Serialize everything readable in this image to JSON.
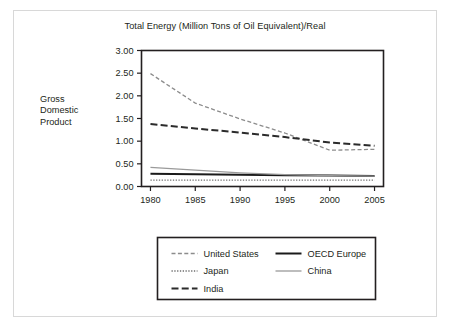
{
  "figure": {
    "title": "Total Energy (Million Tons of Oil Equivalent)/Real",
    "y_axis_title_lines": [
      "Gross",
      "Domestic",
      "Product"
    ],
    "y_axis_title": "Gross Domestic Product"
  },
  "colors": {
    "text": "#231f20",
    "outer_frame": "#d8d8d8",
    "plot_frame": "#231f20",
    "united_states": "#8c8c8c",
    "japan": "#6e6e6e",
    "india": "#2b2b2b",
    "oecd_europe": "#1a1a1a",
    "china": "#9a9a9a",
    "background": "#ffffff"
  },
  "chart_data": {
    "type": "line",
    "title": "Total Energy (Million Tons of Oil Equivalent)/Real",
    "xlabel": "",
    "ylabel": "Gross Domestic Product",
    "xlim": [
      1979,
      2006
    ],
    "ylim": [
      0.0,
      3.0
    ],
    "grid": false,
    "legend_position": "bottom",
    "x_ticks": [
      1980,
      1985,
      1990,
      1995,
      2000,
      2005
    ],
    "x_tick_labels": [
      "1980",
      "1985",
      "1990",
      "1995",
      "2000",
      "2005"
    ],
    "y_ticks": [
      0.0,
      0.5,
      1.0,
      1.5,
      2.0,
      2.5,
      3.0
    ],
    "y_tick_labels": [
      "0.00",
      "0.50",
      "1.00",
      "1.50",
      "2.00",
      "2.50",
      "3.00"
    ],
    "x": [
      1980,
      1985,
      1990,
      1995,
      2000,
      2005
    ],
    "series": [
      {
        "name": "United States",
        "key": "united_states",
        "style": "dashed",
        "color": "#8c8c8c",
        "width": 1.3,
        "dash": "4,2.4",
        "values": [
          2.49,
          1.84,
          1.49,
          1.18,
          0.8,
          0.82
        ]
      },
      {
        "name": "Japan",
        "key": "japan",
        "style": "dotted",
        "color": "#6e6e6e",
        "width": 1.3,
        "dash": "1.3,1.5",
        "values": [
          0.14,
          0.14,
          0.14,
          0.14,
          0.14,
          0.14
        ]
      },
      {
        "name": "India",
        "key": "india",
        "style": "long-dashed",
        "color": "#2b2b2b",
        "width": 2.0,
        "dash": "7,3.2",
        "values": [
          1.38,
          1.28,
          1.19,
          1.09,
          0.97,
          0.9
        ]
      },
      {
        "name": "OECD Europe",
        "key": "oecd_europe",
        "style": "solid",
        "color": "#1a1a1a",
        "width": 2.0,
        "dash": "none",
        "values": [
          0.28,
          0.27,
          0.26,
          0.25,
          0.24,
          0.23
        ]
      },
      {
        "name": "China",
        "key": "china",
        "style": "solid",
        "color": "#9a9a9a",
        "width": 1.3,
        "dash": "none",
        "values": [
          0.42,
          0.36,
          0.3,
          0.26,
          0.24,
          0.23
        ]
      }
    ]
  },
  "legend": {
    "entries": [
      {
        "label": "United States",
        "key": "united_states",
        "column": 0,
        "row": 0
      },
      {
        "label": "Japan",
        "key": "japan",
        "column": 0,
        "row": 1
      },
      {
        "label": "India",
        "key": "india",
        "column": 0,
        "row": 2
      },
      {
        "label": "OECD Europe",
        "key": "oecd_europe",
        "column": 1,
        "row": 0
      },
      {
        "label": "China",
        "key": "china",
        "column": 1,
        "row": 1
      }
    ]
  }
}
